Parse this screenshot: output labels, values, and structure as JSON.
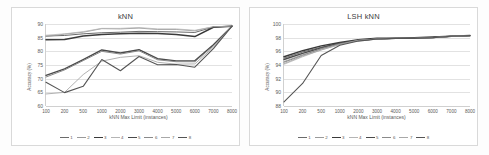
{
  "page": {
    "background": "#ffffff",
    "card_border_color": "#d9d9d9"
  },
  "charts": [
    {
      "id": "knn",
      "title": "kNN",
      "xlabel": "kNN Max Limit (instances)",
      "ylabel": "Accuracy (%)",
      "yticks": [
        "90",
        "85",
        "80",
        "75",
        "70",
        "65",
        "60"
      ],
      "xticks": [
        "100",
        "200",
        "500",
        "1000",
        "2000",
        "3000",
        "4000",
        "5000",
        "6000",
        "7000",
        "8000"
      ],
      "legend": [
        "1",
        "2",
        "3",
        "4",
        "5",
        "6",
        "7",
        "8"
      ]
    },
    {
      "id": "lsh-knn",
      "title": "LSH kNN",
      "xlabel": "kNN Max Limit (instances)",
      "ylabel": "Accuracy (%)",
      "yticks": [
        "100",
        "98",
        "96",
        "94",
        "92",
        "90",
        "88"
      ],
      "xticks": [
        "100",
        "200",
        "500",
        "1000",
        "2000",
        "3000",
        "4000",
        "5000",
        "6000",
        "7000",
        "8000"
      ],
      "legend": [
        "1",
        "2",
        "3",
        "4",
        "5",
        "6",
        "7",
        "8"
      ]
    }
  ],
  "chart_data": [
    {
      "type": "line",
      "title": "kNN",
      "xlabel": "kNN Max Limit (instances)",
      "ylabel": "Accuracy (%)",
      "categories": [
        "100",
        "200",
        "500",
        "1000",
        "2000",
        "3000",
        "4000",
        "5000",
        "6000",
        "7000",
        "8000"
      ],
      "ylim": [
        60,
        90
      ],
      "yticks": [
        60,
        65,
        70,
        75,
        80,
        85,
        90
      ],
      "grid": "horizontal",
      "legend_position": "bottom",
      "series": [
        {
          "name": "1",
          "color": "#6b6b6b",
          "width": 1.0,
          "values": [
            85.6,
            85.8,
            86.4,
            86.8,
            87.0,
            87.3,
            87.2,
            87.1,
            86.9,
            88.9,
            89.2
          ]
        },
        {
          "name": "2",
          "color": "#9a9a9a",
          "width": 0.9,
          "values": [
            85.4,
            86.3,
            87.0,
            88.3,
            88.2,
            88.5,
            88.0,
            88.0,
            87.5,
            89.0,
            89.2
          ]
        },
        {
          "name": "3",
          "color": "#3a3a3a",
          "width": 1.5,
          "values": [
            84.2,
            84.3,
            85.6,
            86.2,
            86.4,
            86.6,
            86.5,
            86.2,
            85.4,
            88.8,
            89.2
          ]
        },
        {
          "name": "4",
          "color": "#b5b5b5",
          "width": 0.8,
          "values": [
            85.9,
            86.4,
            87.2,
            88.4,
            88.4,
            88.7,
            88.2,
            88.2,
            87.7,
            89.0,
            89.2
          ]
        },
        {
          "name": "5",
          "color": "#4a4a4a",
          "width": 1.4,
          "values": [
            71.2,
            73.6,
            77.0,
            80.5,
            79.4,
            80.6,
            77.3,
            76.5,
            76.5,
            82.4,
            89.2
          ]
        },
        {
          "name": "6",
          "color": "#8a8a8a",
          "width": 1.0,
          "values": [
            70.6,
            73.2,
            76.6,
            80.0,
            79.0,
            80.2,
            76.9,
            76.2,
            76.2,
            82.0,
            89.2
          ]
        },
        {
          "name": "7",
          "color": "#a8a8a8",
          "width": 0.9,
          "values": [
            64.4,
            65.0,
            71.5,
            76.4,
            77.8,
            78.4,
            76.0,
            75.3,
            75.4,
            81.5,
            89.2
          ]
        },
        {
          "name": "8",
          "color": "#555555",
          "width": 1.1,
          "values": [
            68.7,
            64.9,
            67.2,
            77.0,
            72.9,
            78.1,
            75.1,
            75.2,
            74.2,
            81.0,
            89.2
          ]
        }
      ]
    },
    {
      "type": "line",
      "title": "LSH kNN",
      "xlabel": "kNN Max Limit (instances)",
      "ylabel": "Accuracy (%)",
      "categories": [
        "100",
        "200",
        "500",
        "1000",
        "2000",
        "3000",
        "4000",
        "5000",
        "6000",
        "7000",
        "8000"
      ],
      "ylim": [
        88,
        100
      ],
      "yticks": [
        88,
        90,
        92,
        94,
        96,
        98,
        100
      ],
      "grid": "horizontal",
      "legend_position": "bottom",
      "series": [
        {
          "name": "1",
          "color": "#6b6b6b",
          "width": 1.0,
          "values": [
            95.0,
            95.9,
            96.6,
            97.2,
            97.6,
            97.8,
            97.9,
            97.9,
            98.0,
            98.2,
            98.3
          ]
        },
        {
          "name": "2",
          "color": "#9a9a9a",
          "width": 0.9,
          "values": [
            94.5,
            95.5,
            96.3,
            97.1,
            97.6,
            97.8,
            97.9,
            97.9,
            98.0,
            98.2,
            98.3
          ]
        },
        {
          "name": "3",
          "color": "#3a3a3a",
          "width": 1.5,
          "values": [
            95.2,
            96.1,
            96.8,
            97.3,
            97.7,
            97.9,
            97.9,
            98.0,
            98.1,
            98.2,
            98.3
          ]
        },
        {
          "name": "4",
          "color": "#b5b5b5",
          "width": 0.8,
          "values": [
            94.1,
            95.2,
            96.2,
            97.0,
            97.6,
            97.8,
            97.9,
            97.9,
            98.0,
            98.2,
            98.3
          ]
        },
        {
          "name": "5",
          "color": "#4a4a4a",
          "width": 1.4,
          "values": [
            94.8,
            95.7,
            96.5,
            97.2,
            97.6,
            97.8,
            97.9,
            97.9,
            98.0,
            98.2,
            98.3
          ]
        },
        {
          "name": "6",
          "color": "#8a8a8a",
          "width": 1.0,
          "values": [
            94.4,
            95.4,
            96.4,
            97.1,
            97.6,
            97.8,
            97.9,
            97.9,
            98.0,
            98.2,
            98.3
          ]
        },
        {
          "name": "7",
          "color": "#a8a8a8",
          "width": 0.9,
          "values": [
            94.2,
            95.3,
            96.2,
            97.0,
            97.6,
            97.8,
            97.9,
            97.9,
            98.0,
            98.2,
            98.3
          ]
        },
        {
          "name": "8",
          "color": "#555555",
          "width": 1.1,
          "values": [
            88.6,
            91.3,
            95.4,
            96.9,
            97.5,
            97.8,
            97.9,
            97.9,
            98.0,
            98.2,
            98.3
          ]
        }
      ]
    }
  ]
}
